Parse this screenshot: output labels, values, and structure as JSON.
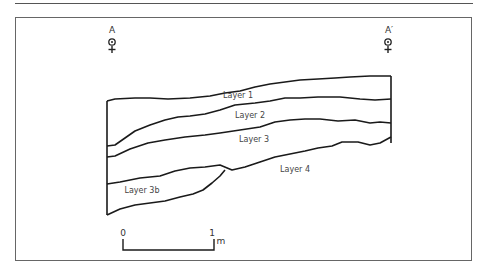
{
  "diagram": {
    "type": "geological-cross-section",
    "section_markers": [
      {
        "id": "start",
        "label": "A"
      },
      {
        "id": "end",
        "label": "A′"
      }
    ],
    "layers": [
      {
        "label": "Layer 1"
      },
      {
        "label": "Layer 2"
      },
      {
        "label": "Layer 3"
      },
      {
        "label": "Layer 4"
      },
      {
        "label": "Layer 3b"
      }
    ],
    "scale_bar": {
      "start_label": "0",
      "end_label": "1",
      "unit": "m"
    },
    "colors": {
      "line": "#1a1a1a",
      "frame": "#666666",
      "text": "#444444"
    }
  }
}
